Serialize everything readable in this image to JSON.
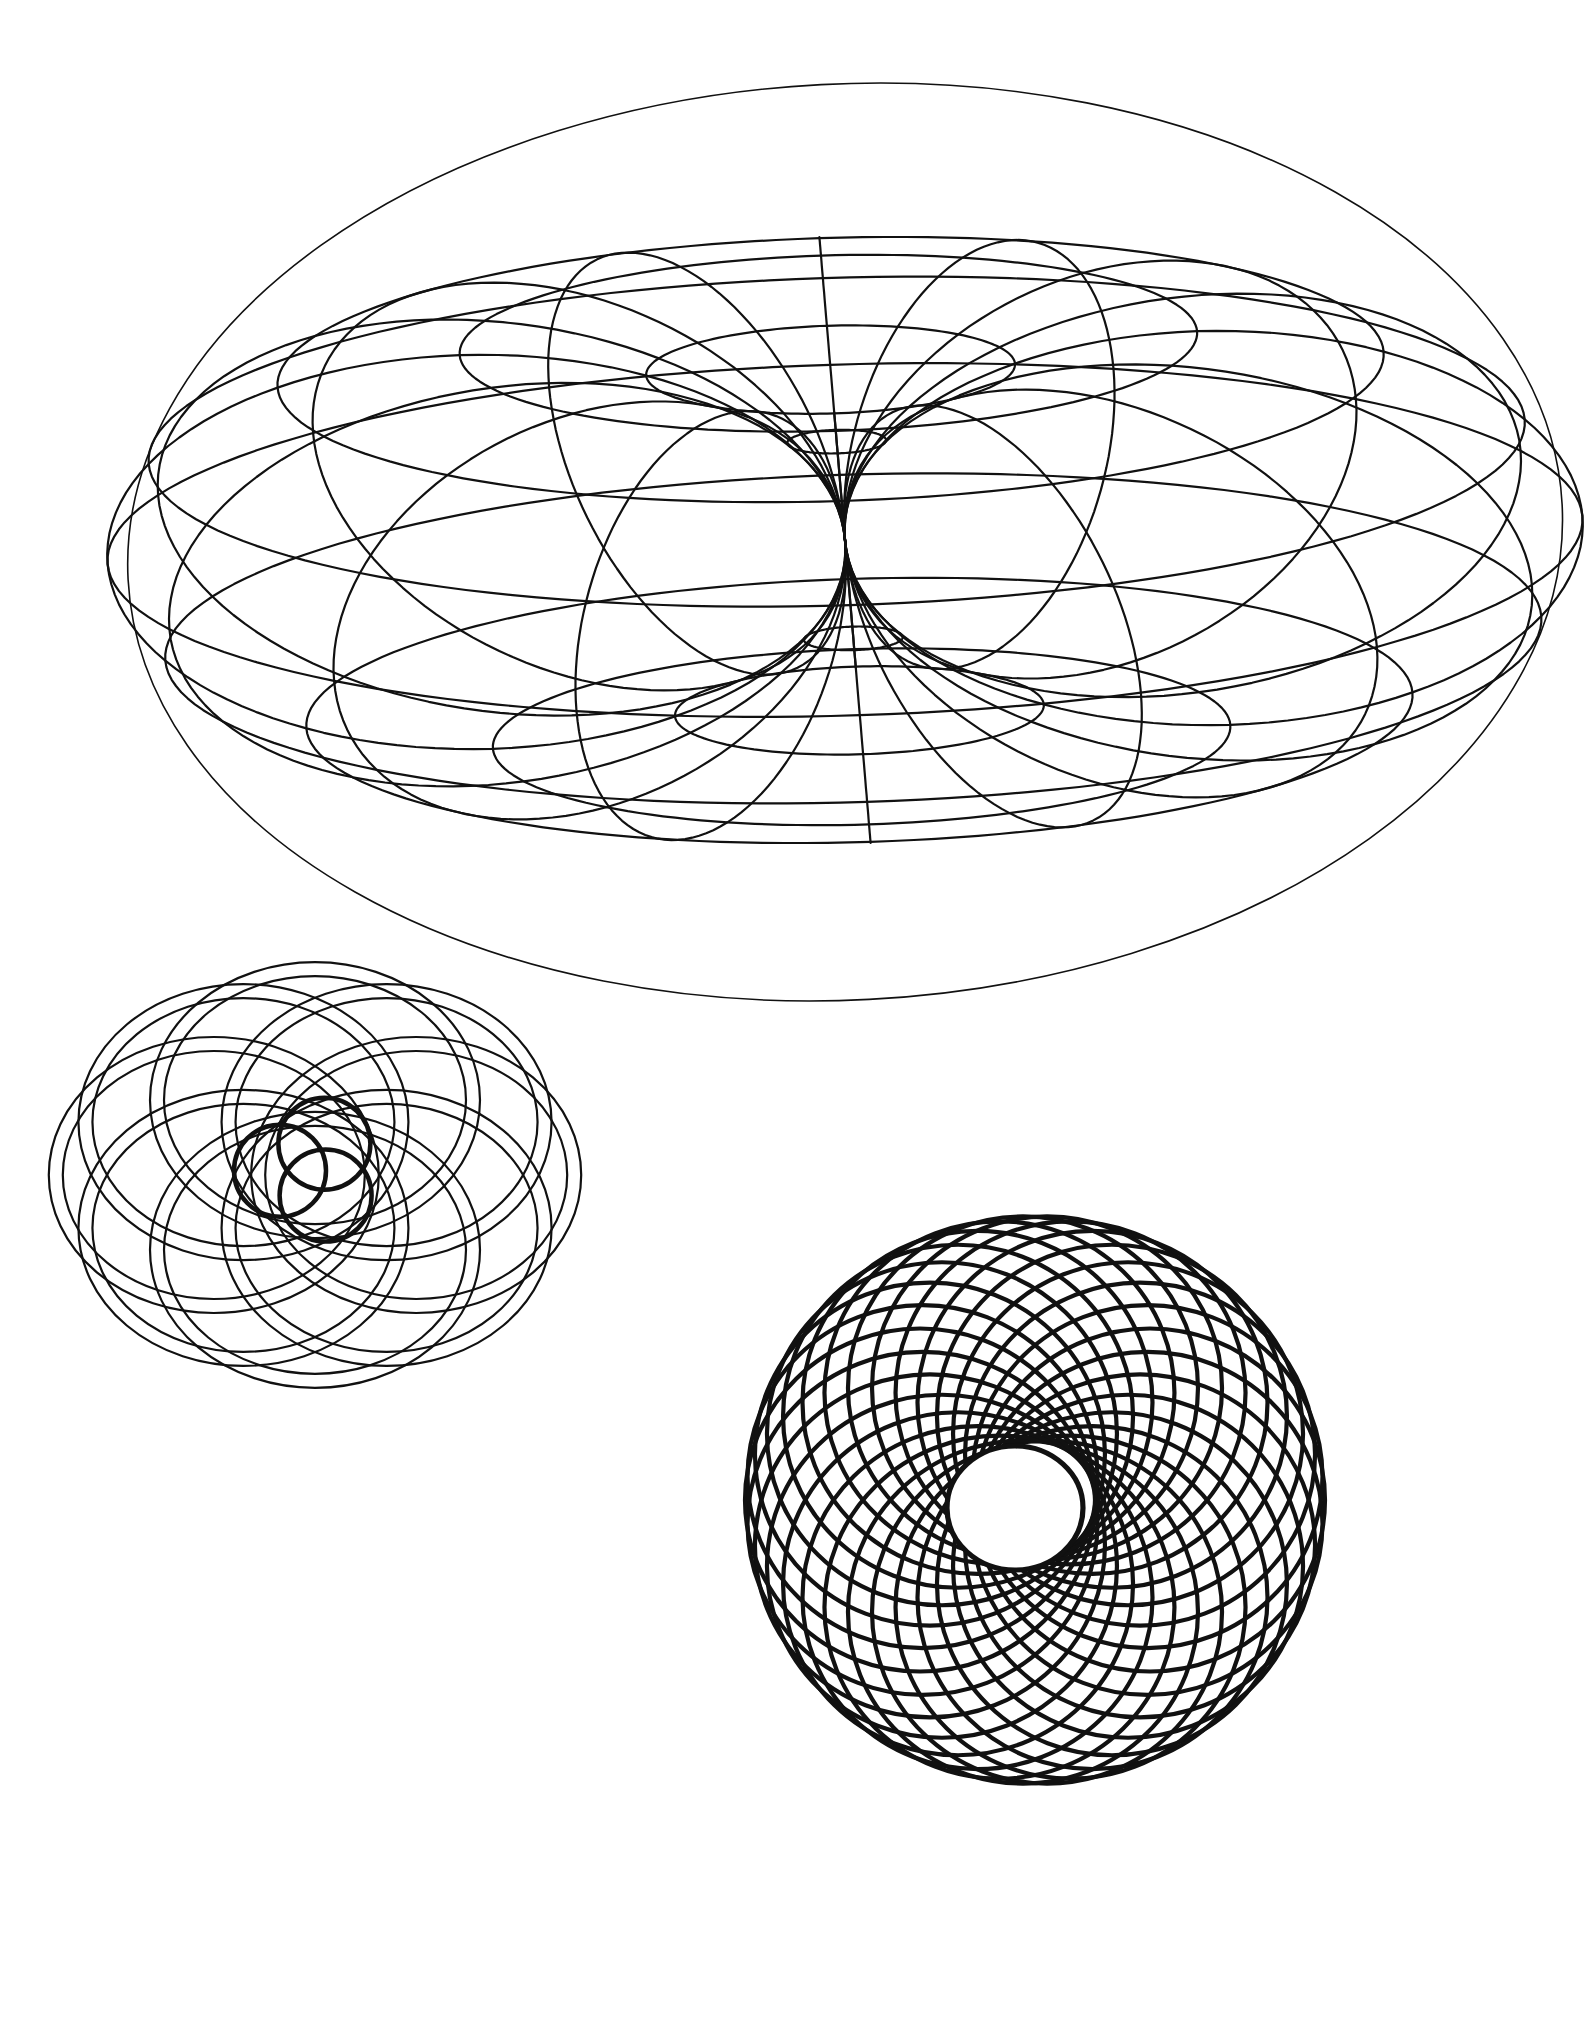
{
  "page": {
    "background": "#ffffff",
    "ink": "#111111",
    "width": 1592,
    "height": 2040
  },
  "figures": {
    "torus": {
      "label": "wireframe-horn-torus",
      "cx": 845,
      "cy": 540,
      "R": 355,
      "r": 355,
      "scaleX": 1.04,
      "tilt_deg": 24,
      "roll_deg": -3,
      "meridians": 16,
      "parallels": 12,
      "stroke_width": 2.2,
      "outline_rx": 718,
      "outline_ry": 458
    },
    "flower": {
      "label": "interlaced-ring-rosette",
      "cx": 315,
      "cy": 1175,
      "ring_count": 8,
      "ring_rx": 165,
      "ring_ry": 120,
      "offset": 88,
      "band_gap": 14,
      "stroke_width": 2.2,
      "core": {
        "cx": 310,
        "cy": 1170,
        "circle_r": 46,
        "circle_offset": 30,
        "stroke_width": 4.5
      }
    },
    "spiral": {
      "label": "circle-spiral-torus",
      "cx": 1035,
      "cy": 1500,
      "circle_count": 30,
      "circle_r": 290,
      "inner_r": 60,
      "scale_x": 1.0,
      "scale_y": 0.98,
      "stroke_width": 4.2,
      "hole_cx": 1015,
      "hole_cy": 1508,
      "hole_rx": 68,
      "hole_ry": 62
    }
  }
}
